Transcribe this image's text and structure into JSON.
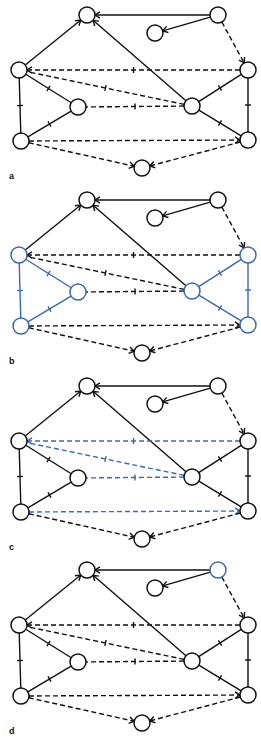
{
  "figure": {
    "colors": {
      "default": "#111111",
      "highlight": "#3b68ae"
    },
    "nodes": [
      {
        "id": "top"
      },
      {
        "id": "top_right"
      },
      {
        "id": "small"
      },
      {
        "id": "left"
      },
      {
        "id": "right"
      },
      {
        "id": "inner_left"
      },
      {
        "id": "inner_right"
      },
      {
        "id": "bottom_left"
      },
      {
        "id": "bottom_right"
      },
      {
        "id": "bottom_center"
      }
    ],
    "edges": [
      {
        "id": "e1",
        "from": "top_right",
        "to": "top",
        "style": "solid",
        "head": "arrow"
      },
      {
        "id": "e2",
        "from": "top_right",
        "to": "small",
        "style": "solid",
        "head": "arrow"
      },
      {
        "id": "e3",
        "from": "top_right",
        "to": "right",
        "style": "dashed",
        "head": "arrow"
      },
      {
        "id": "e4",
        "from": "left",
        "to": "top",
        "style": "solid",
        "head": "arrow"
      },
      {
        "id": "e5",
        "from": "inner_right",
        "to": "top",
        "style": "solid",
        "head": "arrow"
      },
      {
        "id": "e6",
        "from": "right",
        "to": "left",
        "style": "dashed",
        "head": "arrow",
        "mid": "bar"
      },
      {
        "id": "e7",
        "from": "inner_right",
        "to": "left",
        "style": "dashed",
        "head": "none",
        "mid": "bar"
      },
      {
        "id": "e8",
        "from": "inner_right",
        "to": "inner_left",
        "style": "dashed",
        "head": "none",
        "mid": "bar"
      },
      {
        "id": "e9",
        "from": "bottom_left",
        "to": "bottom_right",
        "style": "dashed",
        "head": "arrow"
      },
      {
        "id": "e10",
        "from": "bottom_left",
        "to": "bottom_center",
        "style": "dashed",
        "head": "arrow"
      },
      {
        "id": "e11",
        "from": "bottom_right",
        "to": "bottom_center",
        "style": "dashed",
        "head": "arrow"
      },
      {
        "id": "e12",
        "from": "left",
        "to": "bottom_left",
        "style": "solid",
        "head": "none",
        "mid": "bar"
      },
      {
        "id": "e13",
        "from": "left",
        "to": "inner_left",
        "style": "solid",
        "head": "none",
        "mid": "bar"
      },
      {
        "id": "e14",
        "from": "inner_left",
        "to": "bottom_left",
        "style": "solid",
        "head": "none",
        "mid": "bar"
      },
      {
        "id": "e15",
        "from": "right",
        "to": "bottom_right",
        "style": "solid",
        "head": "none",
        "mid": "bar"
      },
      {
        "id": "e16",
        "from": "inner_right",
        "to": "right",
        "style": "solid",
        "head": "none",
        "mid": "bar"
      },
      {
        "id": "e17",
        "from": "inner_right",
        "to": "bottom_right",
        "style": "solid",
        "head": "none",
        "mid": "bar"
      }
    ],
    "panels": [
      {
        "label": "a",
        "highlight_nodes": [],
        "highlight_edges": []
      },
      {
        "label": "b",
        "highlight_nodes": [
          "left",
          "inner_left",
          "bottom_left",
          "right",
          "inner_right",
          "bottom_right"
        ],
        "highlight_edges": [
          "e12",
          "e13",
          "e14",
          "e15",
          "e16",
          "e17"
        ]
      },
      {
        "label": "c",
        "highlight_nodes": [],
        "highlight_edges": [
          "e6",
          "e7",
          "e8",
          "e9"
        ]
      },
      {
        "label": "d",
        "highlight_nodes": [
          "top_right"
        ],
        "highlight_edges": []
      }
    ]
  }
}
